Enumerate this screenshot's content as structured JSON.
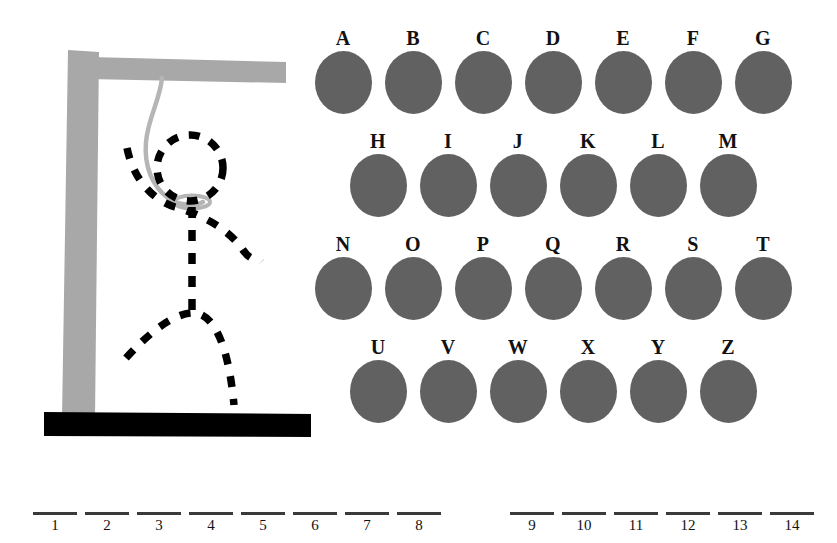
{
  "app": {
    "title": "Hangman",
    "background_color": "#ffffff"
  },
  "gallows": {
    "post_color": "#a8a8a8",
    "beam_color": "#a8a8a8",
    "base_color": "#000000",
    "rope_color": "#b5b5b5",
    "figure_color": "#000000",
    "parts_drawn": [
      "head",
      "arms",
      "body",
      "legs"
    ],
    "parts_remaining": [],
    "rope_name": "noose",
    "base_name": "ground-bar"
  },
  "alphabet": {
    "disc_color": "#616161",
    "label_color": "#111111",
    "rows": [
      {
        "letters": [
          "A",
          "B",
          "C",
          "D",
          "E",
          "F",
          "G"
        ]
      },
      {
        "letters": [
          "H",
          "I",
          "J",
          "K",
          "L",
          "M"
        ]
      },
      {
        "letters": [
          "N",
          "O",
          "P",
          "Q",
          "R",
          "S",
          "T"
        ]
      },
      {
        "letters": [
          "U",
          "V",
          "W",
          "X",
          "Y",
          "Z"
        ]
      }
    ]
  },
  "answer": {
    "rule_color": "#3a3a3a",
    "total_slots": 14,
    "word_gap_after_slot": 8,
    "slots": [
      {
        "number": "1",
        "letter": "",
        "x": 33
      },
      {
        "number": "2",
        "letter": "",
        "x": 85
      },
      {
        "number": "3",
        "letter": "",
        "x": 137
      },
      {
        "number": "4",
        "letter": "",
        "x": 189
      },
      {
        "number": "5",
        "letter": "",
        "x": 241
      },
      {
        "number": "6",
        "letter": "",
        "x": 293
      },
      {
        "number": "7",
        "letter": "",
        "x": 345
      },
      {
        "number": "8",
        "letter": "",
        "x": 397
      },
      {
        "number": "9",
        "letter": "",
        "x": 510
      },
      {
        "number": "10",
        "letter": "",
        "x": 562
      },
      {
        "number": "11",
        "letter": "",
        "x": 614
      },
      {
        "number": "12",
        "letter": "",
        "x": 666
      },
      {
        "number": "13",
        "letter": "",
        "x": 718
      },
      {
        "number": "14",
        "letter": "",
        "x": 770
      }
    ]
  }
}
